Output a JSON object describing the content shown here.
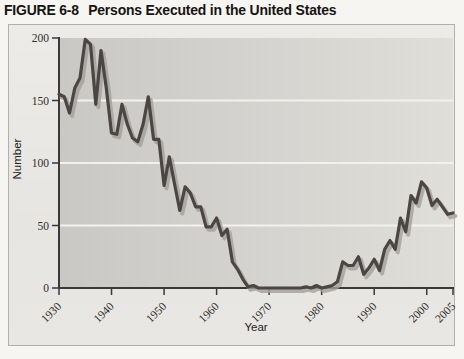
{
  "title": {
    "label": "FIGURE 6-8",
    "text": "Persons Executed in the United States"
  },
  "chart_data": {
    "type": "line",
    "title": "Persons Executed in the United States",
    "xlabel": "Year",
    "ylabel": "Number",
    "x_range": [
      1930,
      2005
    ],
    "x_step": 1,
    "x_ticks": [
      1930,
      1940,
      1950,
      1960,
      1970,
      1980,
      1990,
      2000,
      2005
    ],
    "y_ticks": [
      0,
      50,
      100,
      150,
      200
    ],
    "ylim": [
      0,
      200
    ],
    "grid_values": [
      50,
      100,
      150
    ],
    "grid_on": true,
    "legend": "none",
    "series": [
      {
        "name": "Persons executed",
        "values": [
          155,
          153,
          140,
          160,
          168,
          199,
          195,
          147,
          190,
          160,
          124,
          123,
          147,
          131,
          120,
          117,
          131,
          153,
          119,
          119,
          82,
          105,
          83,
          62,
          81,
          76,
          65,
          65,
          49,
          49,
          56,
          42,
          47,
          21,
          15,
          7,
          1,
          2,
          0,
          0,
          0,
          0,
          0,
          0,
          0,
          0,
          0,
          1,
          0,
          2,
          0,
          1,
          2,
          5,
          21,
          18,
          18,
          25,
          11,
          16,
          23,
          14,
          31,
          38,
          31,
          56,
          45,
          74,
          68,
          85,
          80,
          66,
          71,
          65,
          59,
          60
        ]
      }
    ],
    "colors": {
      "line": "#4b4643",
      "line_shadow": "#a3a09b",
      "plot_bg_left": "#c9c8c4",
      "plot_bg_right": "#e0ded9",
      "gridline": "#f2f1ee",
      "axis": "#3a3938",
      "panel_bg": "#e9e7e3",
      "panel_border": "#b2b0ac",
      "tick_text": "#2e2d2b"
    }
  }
}
